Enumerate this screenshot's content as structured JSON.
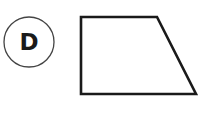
{
  "diagram": {
    "option_label": {
      "letter": "D",
      "circle": {
        "cx": 29,
        "cy": 42,
        "r": 25,
        "stroke": "#444444",
        "stroke_width": 1.3
      },
      "text_color": "#1a1a1a"
    },
    "shape": {
      "type": "trapezoid",
      "points": "81,17 157,17 196,94 81,94",
      "stroke": "#1a1a1a",
      "stroke_width": 2.6,
      "fill": "#ffffff"
    }
  }
}
